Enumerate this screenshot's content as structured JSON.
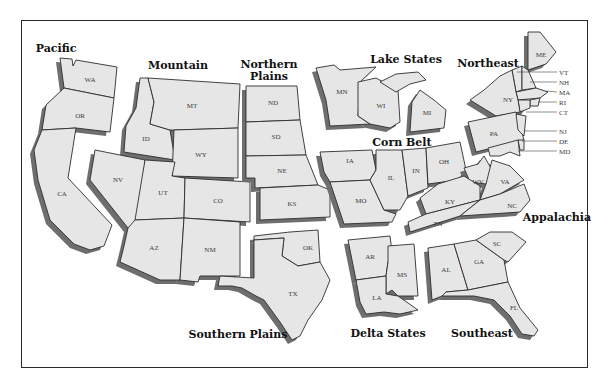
{
  "map": {
    "title": "",
    "colors": {
      "state_fill": "#e6e6e6",
      "state_stroke": "#2e2e2e",
      "shadow": "#6e6e6e",
      "frame": "#2a2a2a",
      "background": "#ffffff"
    },
    "regions": [
      {
        "name": "Pacific",
        "states": [
          "WA",
          "OR",
          "CA"
        ]
      },
      {
        "name": "Mountain",
        "states": [
          "MT",
          "ID",
          "WY",
          "NV",
          "UT",
          "CO",
          "AZ",
          "NM"
        ]
      },
      {
        "name": "Northern Plains",
        "name_line1": "Northern",
        "name_line2": "Plains",
        "states": [
          "ND",
          "SD",
          "NE",
          "KS"
        ]
      },
      {
        "name": "Lake States",
        "states": [
          "MN",
          "WI",
          "MI"
        ]
      },
      {
        "name": "Corn Belt",
        "states": [
          "IA",
          "MO",
          "IL",
          "IN",
          "OH"
        ]
      },
      {
        "name": "Northeast",
        "states": [
          "ME",
          "VT",
          "NH",
          "MA",
          "RI",
          "CT",
          "NY",
          "PA",
          "NJ",
          "DE",
          "MD"
        ]
      },
      {
        "name": "Appalachia",
        "states": [
          "WV",
          "VA",
          "KY",
          "TN",
          "NC"
        ]
      },
      {
        "name": "Southern Plains",
        "states": [
          "OK",
          "TX"
        ]
      },
      {
        "name": "Delta States",
        "states": [
          "AR",
          "MS",
          "LA"
        ]
      },
      {
        "name": "Southeast",
        "states": [
          "SC",
          "GA",
          "AL",
          "FL"
        ]
      }
    ],
    "state_labels": {
      "WA": "WA",
      "OR": "OR",
      "CA": "CA",
      "MT": "MT",
      "ID": "ID",
      "WY": "WY",
      "NV": "NV",
      "UT": "UT",
      "CO": "CO",
      "AZ": "AZ",
      "NM": "NM",
      "ND": "ND",
      "SD": "SD",
      "NE": "NE",
      "KS": "KS",
      "MN": "MN",
      "WI": "WI",
      "MI": "MI",
      "IA": "IA",
      "MO": "MO",
      "IL": "IL",
      "IN": "IN",
      "OH": "OH",
      "ME": "ME",
      "VT": "VT",
      "NH": "NH",
      "MA": "MA",
      "RI": "RI",
      "CT": "CT",
      "NY": "NY",
      "PA": "PA",
      "NJ": "NJ",
      "DE": "DE",
      "MD": "MD",
      "WV": "WV",
      "VA": "VA",
      "KY": "KY",
      "TN": "TN",
      "NC": "NC",
      "OK": "OK",
      "TX": "TX",
      "AR": "AR",
      "MS": "MS",
      "LA": "LA",
      "SC": "SC",
      "GA": "GA",
      "AL": "AL",
      "FL": "FL"
    },
    "region_labels": {
      "pacific": "Pacific",
      "mountain": "Mountain",
      "northern_plains_1": "Northern",
      "northern_plains_2": "Plains",
      "lake_states": "Lake States",
      "corn_belt": "Corn Belt",
      "northeast": "Northeast",
      "appalachia": "Appalachia",
      "southern_plains": "Southern Plains",
      "delta_states": "Delta States",
      "southeast": "Southeast"
    }
  }
}
